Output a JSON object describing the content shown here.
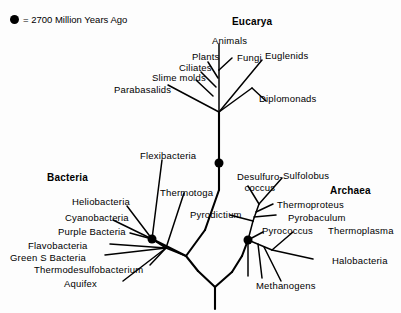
{
  "figure": {
    "width": 401,
    "height": 313,
    "background_color": "#ffffff",
    "line_color": "#000000",
    "node_marker_color": "#000000"
  },
  "legend": {
    "marker_icon": "filled-circle-icon",
    "text": "= 2700 Million Years Ago"
  },
  "domains": [
    {
      "key": "eucarya",
      "label": "Eucarya",
      "x": 232,
      "y": 17
    },
    {
      "key": "bacteria",
      "label": "Bacteria",
      "x": 47,
      "y": 173
    },
    {
      "key": "archaea",
      "label": "Archaea",
      "x": 330,
      "y": 186
    }
  ],
  "taxa": {
    "eucarya": [
      {
        "key": "animals",
        "label": "Animals",
        "x": 212,
        "y": 36
      },
      {
        "key": "plants",
        "label": "Plants",
        "x": 192,
        "y": 52
      },
      {
        "key": "fungi",
        "label": "Fungi",
        "x": 237,
        "y": 53
      },
      {
        "key": "euglenids",
        "label": "Euglenids",
        "x": 265,
        "y": 51
      },
      {
        "key": "ciliates",
        "label": "Ciliates",
        "x": 179,
        "y": 63
      },
      {
        "key": "slime-molds",
        "label": "Slime molds",
        "x": 152,
        "y": 73
      },
      {
        "key": "parabasalids",
        "label": "Parabasalids",
        "x": 114,
        "y": 85
      },
      {
        "key": "diplomonads",
        "label": "Diplomonads",
        "x": 259,
        "y": 94
      }
    ],
    "bacteria": [
      {
        "key": "flexibacteria",
        "label": "Flexibacteria",
        "x": 140,
        "y": 151
      },
      {
        "key": "heliobacteria",
        "label": "Heliobacteria",
        "x": 72,
        "y": 197
      },
      {
        "key": "thermotoga",
        "label": "Thermotoga",
        "x": 160,
        "y": 188
      },
      {
        "key": "cyanobacteria",
        "label": "Cyanobacteria",
        "x": 65,
        "y": 213
      },
      {
        "key": "purple-bacteria",
        "label": "Purple Bacteria",
        "x": 58,
        "y": 227
      },
      {
        "key": "flavobacteria",
        "label": "Flavobacteria",
        "x": 28,
        "y": 241
      },
      {
        "key": "green-s-bacteria",
        "label": "Green S Bacteria",
        "x": 10,
        "y": 253
      },
      {
        "key": "thermodesulfobacterium",
        "label": "Thermodesulfobacterium",
        "x": 34,
        "y": 265
      },
      {
        "key": "aquifex",
        "label": "Aquifex",
        "x": 64,
        "y": 279
      }
    ],
    "archaea": [
      {
        "key": "desulfurococcus",
        "label": "Desulfuro-\ncoccus",
        "line1": "Desulfuro-",
        "line2": "coccus",
        "x": 237,
        "y": 172
      },
      {
        "key": "sulfolobus",
        "label": "Sulfolobus",
        "x": 283,
        "y": 171
      },
      {
        "key": "pyrodictium",
        "label": "Pyrodictium",
        "x": 190,
        "y": 210
      },
      {
        "key": "thermoproteus",
        "label": "Thermoproteus",
        "x": 277,
        "y": 200
      },
      {
        "key": "pyrobaculum",
        "label": "Pyrobaculum",
        "x": 288,
        "y": 213
      },
      {
        "key": "pyrococcus",
        "label": "Pyrococcus",
        "x": 262,
        "y": 226
      },
      {
        "key": "thermoplasma",
        "label": "Thermoplasma",
        "x": 328,
        "y": 226
      },
      {
        "key": "halobacteria",
        "label": "Halobacteria",
        "x": 332,
        "y": 256
      },
      {
        "key": "methanogens",
        "label": "Methanogens",
        "x": 256,
        "y": 281
      }
    ]
  },
  "markers": [
    {
      "key": "eucarya-node",
      "name": "eucarya-2700my-node",
      "x": 219,
      "y": 163,
      "r": 4.5
    },
    {
      "key": "bacteria-node",
      "name": "bacteria-2700my-node",
      "x": 152,
      "y": 239,
      "r": 4.5
    },
    {
      "key": "archaea-node",
      "name": "archaea-2700my-node",
      "x": 248,
      "y": 240,
      "r": 4.5
    }
  ],
  "branches": {
    "trunk": [
      {
        "key": "root-stem",
        "d": "M 215 309 L 215 287"
      },
      {
        "key": "root-fork-left",
        "d": "M 215 287 L 198 271"
      },
      {
        "key": "root-fork-right",
        "d": "M 215 287 L 232 272"
      },
      {
        "key": "bacteria-trunk",
        "d": "M 198 271 L 186 256"
      },
      {
        "key": "bacteria-stem",
        "d": "M 186 256 L 152 239"
      },
      {
        "key": "archaea-trunk",
        "d": "M 232 272 L 242 256"
      },
      {
        "key": "archaea-stem",
        "d": "M 242 256 L 248 240"
      },
      {
        "key": "eucarya-trunk-lower",
        "d": "M 186 256 L 205 230"
      },
      {
        "key": "eucarya-trunk-mid",
        "d": "M 205 230 L 219 190"
      },
      {
        "key": "eucarya-trunk-upper",
        "d": "M 219 190 L 219 112"
      }
    ],
    "eucarya": [
      {
        "key": "eucarya-crown-stem",
        "d": "M 219 112 L 219 70"
      },
      {
        "key": "eucarya-diplomonads-base",
        "d": "M 219 112 L 252 88"
      },
      {
        "key": "eucarya-diplomonads",
        "d": "M 252 88 L 266 101"
      },
      {
        "key": "eucarya-parabasalids",
        "d": "M 219 112 L 168 85"
      },
      {
        "key": "eucarya-slime-molds",
        "d": "M 213 96 L 196 80"
      },
      {
        "key": "eucarya-ciliates",
        "d": "M 216 87 L 201 72"
      },
      {
        "key": "eucarya-plants",
        "d": "M 218 78 L 208 62"
      },
      {
        "key": "eucarya-animals",
        "d": "M 219 70 L 219 44"
      },
      {
        "key": "eucarya-fungi",
        "d": "M 219 70 L 232 58"
      },
      {
        "key": "eucarya-euglenids-base",
        "d": "M 219 112 L 262 60"
      }
    ],
    "bacteria": [
      {
        "key": "bacteria-flexibacteria",
        "d": "M 152 239 L 162 160"
      },
      {
        "key": "bacteria-thermotoga",
        "d": "M 166 248 L 184 193"
      },
      {
        "key": "bacteria-heliobacteria",
        "d": "M 152 239 L 127 206"
      },
      {
        "key": "bacteria-cyanobacteria",
        "d": "M 152 239 L 113 220"
      },
      {
        "key": "bacteria-purple",
        "d": "M 152 239 L 130 233"
      },
      {
        "key": "bacteria-flavobacteria",
        "d": "M 166 248 L 110 244"
      },
      {
        "key": "bacteria-green-s",
        "d": "M 166 248 L 105 255"
      },
      {
        "key": "bacteria-thermodesulfo",
        "d": "M 166 248 L 150 265"
      },
      {
        "key": "bacteria-aquifex",
        "d": "M 166 248 L 123 281"
      },
      {
        "key": "bacteria-hub-link",
        "d": "M 152 239 L 166 248"
      },
      {
        "key": "bacteria-hub-to-trunk",
        "d": "M 166 248 L 186 256"
      }
    ],
    "archaea": [
      {
        "key": "archaea-crenarchaeota-stem",
        "d": "M 248 240 L 253 221"
      },
      {
        "key": "archaea-pyrodictium",
        "d": "M 253 221 L 230 215"
      },
      {
        "key": "archaea-desulfurococcus-stem",
        "d": "M 253 221 L 259 204"
      },
      {
        "key": "archaea-desulfurococcus",
        "d": "M 259 204 L 248 186"
      },
      {
        "key": "archaea-sulfolobus",
        "d": "M 259 204 L 282 178"
      },
      {
        "key": "archaea-thermoproteus",
        "d": "M 256 212 L 273 204"
      },
      {
        "key": "archaea-pyrobaculum",
        "d": "M 254 217 L 276 215"
      },
      {
        "key": "archaea-pyrococcus",
        "d": "M 248 240 L 263 232"
      },
      {
        "key": "archaea-euryarchaeota-stem",
        "d": "M 248 240 L 272 250"
      },
      {
        "key": "archaea-thermoplasma",
        "d": "M 272 250 L 293 232"
      },
      {
        "key": "archaea-halobacteria",
        "d": "M 272 250 L 313 259"
      },
      {
        "key": "archaea-methanogen-a",
        "d": "M 248 240 L 248 276"
      },
      {
        "key": "archaea-methanogen-b",
        "d": "M 258 244 L 262 278"
      },
      {
        "key": "archaea-methanogen-c",
        "d": "M 264 247 L 281 281"
      }
    ]
  }
}
